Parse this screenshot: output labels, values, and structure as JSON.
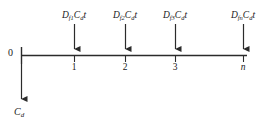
{
  "figure": {
    "name": "cash-flow-timeline",
    "colors": {
      "line": "#2b2b2b",
      "text": "#1a1a1a",
      "background": "#ffffff"
    },
    "origin_label": "0",
    "outflow": {
      "symbol": "C",
      "subscript": "d",
      "direction": "down"
    },
    "timeline": {
      "start_x": 21,
      "end_x": 247,
      "y": 55
    },
    "periods": [
      {
        "tick_label": "1",
        "tick_italic": false,
        "x": 74,
        "inflow_symbol": "D",
        "inflow_subscript": "f1",
        "inflow_factor": "C",
        "inflow_factor_subscript": "d",
        "inflow_suffix": "t",
        "label_text": "Df1Cdt"
      },
      {
        "tick_label": "2",
        "tick_italic": false,
        "x": 125,
        "inflow_symbol": "D",
        "inflow_subscript": "f2",
        "inflow_factor": "C",
        "inflow_factor_subscript": "d",
        "inflow_suffix": "t",
        "label_text": "Df2Cdt"
      },
      {
        "tick_label": "3",
        "tick_italic": false,
        "x": 175,
        "inflow_symbol": "D",
        "inflow_subscript": "f3",
        "inflow_factor": "C",
        "inflow_factor_subscript": "d",
        "inflow_suffix": "t",
        "label_text": "Df3Cdt"
      },
      {
        "tick_label": "n",
        "tick_italic": true,
        "x": 243,
        "inflow_symbol": "D",
        "inflow_subscript": "fn",
        "inflow_factor": "C",
        "inflow_factor_subscript": "d",
        "inflow_suffix": "t",
        "label_text": "DfnCdt"
      }
    ]
  }
}
